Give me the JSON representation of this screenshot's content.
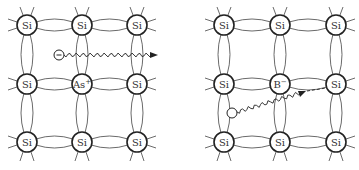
{
  "diagram": {
    "type": "semiconductor-lattice-doping",
    "colors": {
      "line": "#444444",
      "atom_stroke": "#222222",
      "background": "#ffffff",
      "arrow": "#222222"
    },
    "panels": [
      {
        "id": "n-type",
        "atoms": [
          [
            "Si",
            "Si",
            "Si"
          ],
          [
            "Si",
            "As+",
            "Si"
          ],
          [
            "Si",
            "Si",
            "Si"
          ]
        ],
        "dopant": {
          "base": "As",
          "charge": "+"
        },
        "carrier": {
          "symbol": "−",
          "kind": "electron",
          "label": "free-electron"
        }
      },
      {
        "id": "p-type",
        "atoms": [
          [
            "Si",
            "Si",
            "Si"
          ],
          [
            "Si",
            "B−",
            "Si"
          ],
          [
            "Si",
            "Si",
            "Si"
          ]
        ],
        "dopant": {
          "base": "B",
          "charge": "−"
        },
        "carrier": {
          "symbol": "",
          "kind": "hole",
          "label": "hole"
        }
      }
    ]
  }
}
